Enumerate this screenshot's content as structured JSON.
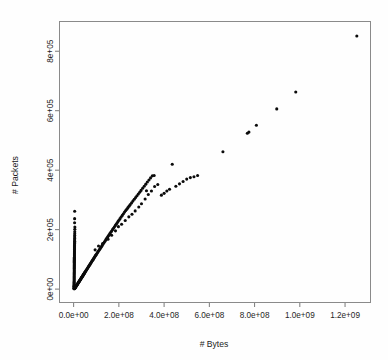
{
  "figure": {
    "background_color": "#ffffff",
    "frame_color": "#8a8a8a",
    "point_color": "#0b0b0b"
  },
  "chart_data": {
    "type": "scatter",
    "title": "",
    "xlabel": "# Bytes",
    "ylabel": "# Packets",
    "xlim": [
      -62500000,
      1312500000
    ],
    "ylim": [
      -45000,
      900000
    ],
    "xticks": [
      0,
      200000000,
      400000000,
      600000000,
      800000000,
      1000000000,
      1200000000
    ],
    "xticklabels": [
      "0.0e+00",
      "2.0e+08",
      "4.0e+08",
      "6.0e+08",
      "8.0e+08",
      "1.0e+09",
      "1.2e+09"
    ],
    "yticks": [
      0,
      200000,
      400000,
      600000,
      800000
    ],
    "yticklabels": [
      "0e+00",
      "2e+05",
      "4e+05",
      "6e+05",
      "8e+05"
    ],
    "grid": false,
    "legend": null,
    "marker": "filled-circle",
    "marker_size_px": 3.1,
    "tick_label_rotation": {
      "x": 0,
      "y": 90
    },
    "series": [
      {
        "name": "flows",
        "description": "Near-vertical cluster of small-byte flows at x~0 rising to 2.6e5 packets, plus a dense linear main trend of packets vs bytes extending to a far outlier at 1.25e9 bytes.",
        "points": [
          [
            1500000,
            2000
          ],
          [
            1600000,
            4500
          ],
          [
            1700000,
            7000
          ],
          [
            1800000,
            9500
          ],
          [
            1900000,
            12000
          ],
          [
            2000000,
            15000
          ],
          [
            2100000,
            18000
          ],
          [
            2150000,
            21000
          ],
          [
            2200000,
            24000
          ],
          [
            2250000,
            27000
          ],
          [
            2300000,
            30500
          ],
          [
            2350000,
            34000
          ],
          [
            2400000,
            37500
          ],
          [
            2450000,
            41000
          ],
          [
            2500000,
            44500
          ],
          [
            2550000,
            48000
          ],
          [
            2600000,
            51500
          ],
          [
            2650000,
            55000
          ],
          [
            2700000,
            58500
          ],
          [
            2750000,
            62000
          ],
          [
            2800000,
            65500
          ],
          [
            2850000,
            69000
          ],
          [
            2900000,
            72500
          ],
          [
            2950000,
            76000
          ],
          [
            3000000,
            79500
          ],
          [
            3050000,
            83000
          ],
          [
            3100000,
            86500
          ],
          [
            3150000,
            90000
          ],
          [
            3200000,
            93500
          ],
          [
            3250000,
            97000
          ],
          [
            3300000,
            100500
          ],
          [
            3350000,
            104000
          ],
          [
            3400000,
            107500
          ],
          [
            3450000,
            111000
          ],
          [
            3500000,
            114500
          ],
          [
            3550000,
            118000
          ],
          [
            3600000,
            121500
          ],
          [
            3650000,
            125000
          ],
          [
            3700000,
            128500
          ],
          [
            3750000,
            132000
          ],
          [
            3800000,
            135500
          ],
          [
            3850000,
            139000
          ],
          [
            3900000,
            142500
          ],
          [
            3950000,
            146000
          ],
          [
            4000000,
            149500
          ],
          [
            4100000,
            153000
          ],
          [
            4200000,
            157000
          ],
          [
            4300000,
            161000
          ],
          [
            4400000,
            165500
          ],
          [
            4500000,
            170000
          ],
          [
            4600000,
            175000
          ],
          [
            4700000,
            180000
          ],
          [
            4800000,
            186000
          ],
          [
            5000000,
            193000
          ],
          [
            5200000,
            201000
          ],
          [
            5400000,
            209000
          ],
          [
            4200000,
            223000
          ],
          [
            4400000,
            237000
          ],
          [
            4600000,
            262000
          ],
          [
            2000000,
            1000
          ],
          [
            3000000,
            1500
          ],
          [
            4000000,
            2200
          ],
          [
            5000000,
            3000
          ],
          [
            6000000,
            4000
          ],
          [
            7000000,
            5000
          ],
          [
            8000000,
            6200
          ],
          [
            9000000,
            7400
          ],
          [
            10000000,
            8600
          ],
          [
            11000000,
            9800
          ],
          [
            12000000,
            11000
          ],
          [
            13000000,
            12200
          ],
          [
            14000000,
            13400
          ],
          [
            15000000,
            14600
          ],
          [
            16000000,
            15800
          ],
          [
            17000000,
            17000
          ],
          [
            18000000,
            18200
          ],
          [
            19000000,
            19400
          ],
          [
            20000000,
            20600
          ],
          [
            21000000,
            21800
          ],
          [
            22000000,
            23000
          ],
          [
            23000000,
            24200
          ],
          [
            24000000,
            25400
          ],
          [
            25000000,
            26600
          ],
          [
            26000000,
            27800
          ],
          [
            27000000,
            29000
          ],
          [
            28000000,
            30200
          ],
          [
            29000000,
            31400
          ],
          [
            30000000,
            32600
          ],
          [
            31000000,
            33800
          ],
          [
            32000000,
            35000
          ],
          [
            33000000,
            36200
          ],
          [
            34000000,
            37400
          ],
          [
            35000000,
            38600
          ],
          [
            36000000,
            39800
          ],
          [
            37000000,
            41000
          ],
          [
            38000000,
            42200
          ],
          [
            39000000,
            43400
          ],
          [
            40000000,
            44600
          ],
          [
            41000000,
            45800
          ],
          [
            42000000,
            47000
          ],
          [
            43000000,
            48200
          ],
          [
            44000000,
            49400
          ],
          [
            45000000,
            50600
          ],
          [
            46000000,
            51800
          ],
          [
            47000000,
            53000
          ],
          [
            48000000,
            54200
          ],
          [
            49000000,
            55400
          ],
          [
            50000000,
            56600
          ],
          [
            52000000,
            59000
          ],
          [
            54000000,
            61400
          ],
          [
            56000000,
            63800
          ],
          [
            58000000,
            66200
          ],
          [
            60000000,
            68600
          ],
          [
            62000000,
            71000
          ],
          [
            64000000,
            73400
          ],
          [
            66000000,
            75800
          ],
          [
            68000000,
            78200
          ],
          [
            70000000,
            80600
          ],
          [
            72000000,
            83000
          ],
          [
            74000000,
            85400
          ],
          [
            76000000,
            87800
          ],
          [
            78000000,
            90200
          ],
          [
            80000000,
            92600
          ],
          [
            82000000,
            95000
          ],
          [
            84000000,
            97400
          ],
          [
            86000000,
            99800
          ],
          [
            88000000,
            102200
          ],
          [
            90000000,
            104600
          ],
          [
            92000000,
            107000
          ],
          [
            94000000,
            109400
          ],
          [
            96000000,
            111800
          ],
          [
            98000000,
            114200
          ],
          [
            100000000,
            116600
          ],
          [
            103000000,
            120000
          ],
          [
            106000000,
            123500
          ],
          [
            109000000,
            127000
          ],
          [
            112000000,
            130500
          ],
          [
            115000000,
            134000
          ],
          [
            118000000,
            137500
          ],
          [
            121000000,
            141000
          ],
          [
            124000000,
            144500
          ],
          [
            127000000,
            148000
          ],
          [
            130000000,
            151500
          ],
          [
            133000000,
            155000
          ],
          [
            136000000,
            158500
          ],
          [
            139000000,
            162000
          ],
          [
            142000000,
            165500
          ],
          [
            145000000,
            169000
          ],
          [
            148000000,
            172500
          ],
          [
            151000000,
            176000
          ],
          [
            154000000,
            179500
          ],
          [
            157000000,
            183000
          ],
          [
            160000000,
            186500
          ],
          [
            164000000,
            191000
          ],
          [
            168000000,
            195500
          ],
          [
            172000000,
            200000
          ],
          [
            176000000,
            204500
          ],
          [
            180000000,
            209000
          ],
          [
            184000000,
            213500
          ],
          [
            188000000,
            218000
          ],
          [
            192000000,
            222500
          ],
          [
            196000000,
            227000
          ],
          [
            200000000,
            231500
          ],
          [
            205000000,
            237000
          ],
          [
            210000000,
            242500
          ],
          [
            215000000,
            248000
          ],
          [
            220000000,
            253500
          ],
          [
            225000000,
            259000
          ],
          [
            230000000,
            264000
          ],
          [
            235000000,
            269000
          ],
          [
            240000000,
            274000
          ],
          [
            245000000,
            279000
          ],
          [
            250000000,
            284000
          ],
          [
            256000000,
            290000
          ],
          [
            262000000,
            296000
          ],
          [
            268000000,
            302000
          ],
          [
            274000000,
            308000
          ],
          [
            280000000,
            314000
          ],
          [
            286000000,
            320000
          ],
          [
            292000000,
            326000
          ],
          [
            298000000,
            332000
          ],
          [
            305000000,
            339000
          ],
          [
            312000000,
            346000
          ],
          [
            319000000,
            353000
          ],
          [
            326000000,
            360000
          ],
          [
            333000000,
            367000
          ],
          [
            340000000,
            374000
          ],
          [
            348000000,
            381000
          ],
          [
            356000000,
            382000
          ],
          [
            95000000,
            132000
          ],
          [
            110000000,
            145000
          ],
          [
            128000000,
            153000
          ],
          [
            152000000,
            168000
          ],
          [
            168000000,
            181000
          ],
          [
            185000000,
            196000
          ],
          [
            198000000,
            210000
          ],
          [
            212000000,
            218000
          ],
          [
            228000000,
            231000
          ],
          [
            244000000,
            243000
          ],
          [
            258000000,
            252000
          ],
          [
            272000000,
            263000
          ],
          [
            288000000,
            276000
          ],
          [
            300000000,
            287000
          ],
          [
            316000000,
            303000
          ],
          [
            322000000,
            331000
          ],
          [
            330000000,
            318000
          ],
          [
            344000000,
            330000
          ],
          [
            358000000,
            345000
          ],
          [
            372000000,
            352000
          ],
          [
            388000000,
            316000
          ],
          [
            400000000,
            322000
          ],
          [
            412000000,
            330000
          ],
          [
            424000000,
            336000
          ],
          [
            436000000,
            420000
          ],
          [
            452000000,
            346000
          ],
          [
            468000000,
            354000
          ],
          [
            484000000,
            362000
          ],
          [
            500000000,
            370000
          ],
          [
            516000000,
            375000
          ],
          [
            532000000,
            378000
          ],
          [
            548000000,
            382000
          ],
          [
            660000000,
            462000
          ],
          [
            768000000,
            524000
          ],
          [
            775000000,
            528000
          ],
          [
            808000000,
            551000
          ],
          [
            898000000,
            606000
          ],
          [
            982000000,
            663000
          ],
          [
            1252000000,
            851000
          ]
        ]
      }
    ]
  }
}
